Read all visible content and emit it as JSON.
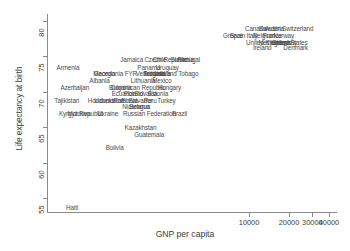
{
  "chart_data": {
    "type": "scatter",
    "title": "",
    "xlabel": "GNP per capita",
    "ylabel": "Life expectancy at birth",
    "xscale": "log",
    "xlim": [
      300,
      46000
    ],
    "ylim": [
      53,
      81
    ],
    "xticks": [
      10000,
      20000,
      30000,
      40000
    ],
    "xtick_labels": [
      "10000",
      "20000",
      "30000",
      "40000"
    ],
    "yticks": [
      55,
      60,
      65,
      70,
      75,
      80
    ],
    "ytick_labels": [
      "55",
      "60",
      "65",
      "70",
      "75",
      "80"
    ],
    "grid": false,
    "legend": "none",
    "marker_style": "text-label-only",
    "points": [
      {
        "label": "Haiti",
        "x": 480,
        "y": 53.6
      },
      {
        "label": "Bolivia",
        "x": 1010,
        "y": 62.1
      },
      {
        "label": "Guatemala",
        "x": 1750,
        "y": 64.0
      },
      {
        "label": "Kazakhstan",
        "x": 1520,
        "y": 64.9
      },
      {
        "label": "Kyrgyz Republic",
        "x": 560,
        "y": 66.9
      },
      {
        "label": "Moldova",
        "x": 520,
        "y": 66.9
      },
      {
        "label": "Ukraine",
        "x": 870,
        "y": 66.9
      },
      {
        "label": "Russian Federation",
        "x": 1850,
        "y": 66.9
      },
      {
        "label": "Brazil",
        "x": 3100,
        "y": 66.9
      },
      {
        "label": "Nicaragua",
        "x": 1420,
        "y": 67.9
      },
      {
        "label": "Belarus",
        "x": 1520,
        "y": 67.9
      },
      {
        "label": "Tajikistan",
        "x": 450,
        "y": 68.8
      },
      {
        "label": "Honduras",
        "x": 760,
        "y": 68.8
      },
      {
        "label": "Uzbekistan",
        "x": 900,
        "y": 68.8
      },
      {
        "label": "Romania",
        "x": 1150,
        "y": 68.8
      },
      {
        "label": "El Salvador",
        "x": 1480,
        "y": 68.8
      },
      {
        "label": "Peru",
        "x": 1800,
        "y": 68.8
      },
      {
        "label": "Turkey",
        "x": 2400,
        "y": 68.8
      },
      {
        "label": "Ecuador",
        "x": 1120,
        "y": 69.7
      },
      {
        "label": "Poland",
        "x": 1350,
        "y": 69.7
      },
      {
        "label": "Slovakia",
        "x": 1700,
        "y": 69.7
      },
      {
        "label": "Estonia",
        "x": 2100,
        "y": 69.7
      },
      {
        "label": "Azerbaijan",
        "x": 500,
        "y": 70.6
      },
      {
        "label": "Bulgaria",
        "x": 1100,
        "y": 70.6
      },
      {
        "label": "Dominican Republic",
        "x": 1500,
        "y": 70.6
      },
      {
        "label": "Hungary",
        "x": 2500,
        "y": 70.6
      },
      {
        "label": "Albania",
        "x": 760,
        "y": 71.6
      },
      {
        "label": "Lithuania",
        "x": 1650,
        "y": 71.6
      },
      {
        "label": "Mexico",
        "x": 2200,
        "y": 71.6
      },
      {
        "label": "Georgia",
        "x": 820,
        "y": 72.6
      },
      {
        "label": "Macedonia FYR",
        "x": 960,
        "y": 72.6
      },
      {
        "label": "Venezuela",
        "x": 1800,
        "y": 72.6
      },
      {
        "label": "Bulgaria 2",
        "x": 2000,
        "y": 72.6
      },
      {
        "label": "Latvia",
        "x": 2300,
        "y": 72.6
      },
      {
        "label": "Trinidad and Tobago",
        "x": 2700,
        "y": 72.6
      },
      {
        "label": "Armenia",
        "x": 430,
        "y": 73.4
      },
      {
        "label": "Panama",
        "x": 1700,
        "y": 73.4
      },
      {
        "label": "Uruguay",
        "x": 2400,
        "y": 73.4
      },
      {
        "label": "Jamaica",
        "x": 1300,
        "y": 74.5
      },
      {
        "label": "Chile",
        "x": 2150,
        "y": 74.5
      },
      {
        "label": "Czech Republic",
        "x": 2400,
        "y": 74.5
      },
      {
        "label": "Slovenia",
        "x": 3200,
        "y": 74.5
      },
      {
        "label": "Portugal",
        "x": 3600,
        "y": 74.5
      },
      {
        "label": "Ireland",
        "x": 13000,
        "y": 76.2
      },
      {
        "label": "Denmark",
        "x": 22000,
        "y": 76.2
      },
      {
        "label": "United Kingdom",
        "x": 14000,
        "y": 77.0
      },
      {
        "label": "Netherlands",
        "x": 16000,
        "y": 77.0
      },
      {
        "label": "Germany",
        "x": 18000,
        "y": 77.0
      },
      {
        "label": "United States",
        "x": 21000,
        "y": 77.0
      },
      {
        "label": "Greece",
        "x": 7500,
        "y": 77.9
      },
      {
        "label": "Spain",
        "x": 8200,
        "y": 77.9
      },
      {
        "label": "Italy",
        "x": 11000,
        "y": 77.9
      },
      {
        "label": "Belgium",
        "x": 13000,
        "y": 77.9
      },
      {
        "label": "France",
        "x": 15000,
        "y": 77.9
      },
      {
        "label": "Norway",
        "x": 18000,
        "y": 77.9
      },
      {
        "label": "Canada",
        "x": 11000,
        "y": 78.9
      },
      {
        "label": "Sweden",
        "x": 14000,
        "y": 78.9
      },
      {
        "label": "Austria",
        "x": 16000,
        "y": 78.9
      },
      {
        "label": "Switzerland",
        "x": 24000,
        "y": 78.9
      }
    ]
  },
  "axes": {
    "y_title": "Life expectancy at birth",
    "x_title": "GNP per capita"
  },
  "labels": {
    "row_80": "80",
    "row_75": "75",
    "row_70": "70",
    "row_65": "65",
    "row_60": "60",
    "row_55": "55"
  }
}
